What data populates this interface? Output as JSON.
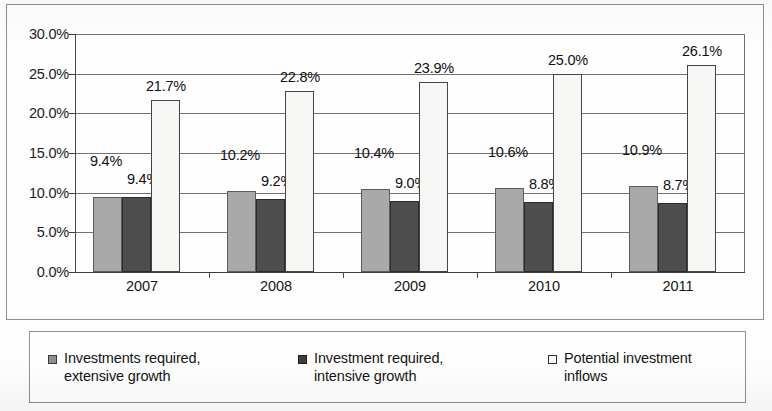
{
  "chart_data": {
    "type": "bar",
    "title": "",
    "subtitle": "",
    "xlabel": "",
    "ylabel": "",
    "categories": [
      "2007",
      "2008",
      "2009",
      "2010",
      "2011"
    ],
    "series": [
      {
        "name": "Investments required, extensive growth",
        "values": [
          9.4,
          10.2,
          10.4,
          10.6,
          10.9
        ],
        "labels": [
          "9.4%",
          "10.2%",
          "10.4%",
          "10.6%",
          "10.9%"
        ],
        "color": "#a9a9a9"
      },
      {
        "name": "Investment required, intensive growth",
        "values": [
          9.4,
          9.2,
          9.0,
          8.8,
          8.7
        ],
        "labels": [
          "9.4%",
          "9.2%",
          "9.0%",
          "8.8%",
          "8.7%"
        ],
        "color": "#4e4e4e"
      },
      {
        "name": "Potential investment inflows",
        "values": [
          21.7,
          22.8,
          23.9,
          25.0,
          26.1
        ],
        "labels": [
          "21.7%",
          "22.8%",
          "23.9%",
          "25.0%",
          "26.1%"
        ],
        "color": "#f6f6f4"
      }
    ],
    "ylim": [
      0,
      30
    ],
    "ytick_values": [
      0,
      5,
      10,
      15,
      20,
      25,
      30
    ],
    "ytick_labels": [
      "0.0%",
      "5.0%",
      "10.0%",
      "15.0%",
      "20.0%",
      "25.0%",
      "30.0%"
    ],
    "grid": true,
    "legend_position": "bottom"
  },
  "axis": {
    "y": {
      "ticks": [
        {
          "label": "30.0%",
          "value": 30
        },
        {
          "label": "25.0%",
          "value": 25
        },
        {
          "label": "20.0%",
          "value": 20
        },
        {
          "label": "15.0%",
          "value": 15
        },
        {
          "label": "10.0%",
          "value": 10
        },
        {
          "label": "5.0%",
          "value": 5
        },
        {
          "label": "0.0%",
          "value": 0
        }
      ]
    },
    "x": {
      "ticks": [
        {
          "label": "2007"
        },
        {
          "label": "2008"
        },
        {
          "label": "2009"
        },
        {
          "label": "2010"
        },
        {
          "label": "2011"
        }
      ]
    }
  },
  "legend": {
    "items": [
      {
        "marker": "filled-gray-square-icon",
        "line1": "Investments required,",
        "line2": "extensive growth"
      },
      {
        "marker": "filled-dark-square-icon",
        "line1": "Investment required,",
        "line2": "intensive growth"
      },
      {
        "marker": "outlined-white-square-icon",
        "line1": "Potential investment",
        "line2": "inflows"
      }
    ]
  }
}
